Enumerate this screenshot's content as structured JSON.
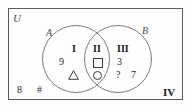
{
  "figure": {
    "universal_set_label": "U",
    "set_a_label": "A",
    "set_b_label": "B"
  },
  "regions": [
    {
      "numeral": "I",
      "name": "A only",
      "elements": [
        "9",
        "triangle"
      ]
    },
    {
      "numeral": "II",
      "name": "A intersect B",
      "elements": [
        "square",
        "circle"
      ]
    },
    {
      "numeral": "III",
      "name": "B only",
      "elements": [
        "3",
        "?",
        "7"
      ]
    },
    {
      "numeral": "IV",
      "name": "outside A and B",
      "elements": [
        "8",
        "#"
      ]
    }
  ],
  "elements": {
    "nine": "9",
    "triangle_glyph": "△",
    "square_glyph": "□",
    "circle_glyph": "○",
    "three": "3",
    "question": "?",
    "seven": "7",
    "eight": "8",
    "hash": "#"
  },
  "colors": {
    "box_stroke": "#5a5a5a",
    "circle_stroke": "#7c7c7c",
    "text": "#2b2b2b",
    "background": "#fdfdfd"
  }
}
